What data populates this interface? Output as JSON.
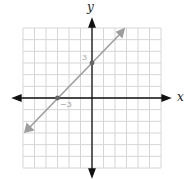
{
  "chart_data": {
    "type": "line",
    "title": "",
    "xlabel": "x",
    "ylabel": "y",
    "xlim": [
      -6,
      6
    ],
    "ylim": [
      -6,
      6
    ],
    "grid": true,
    "series": [
      {
        "name": "y = x + 3",
        "points": [
          [
            -6,
            -3
          ],
          [
            -3,
            0
          ],
          [
            0,
            3
          ],
          [
            3,
            6
          ]
        ],
        "color": "#a0a0a0"
      }
    ],
    "marked_points": [
      [
        -3,
        0
      ],
      [
        0,
        3
      ]
    ],
    "annotations": [
      {
        "text": "3",
        "at": [
          0,
          3
        ]
      },
      {
        "text": "−3",
        "at": [
          -3,
          0
        ]
      }
    ]
  },
  "labels": {
    "x": "x",
    "y": "y",
    "y_intercept": "3",
    "x_intercept": "−3"
  }
}
